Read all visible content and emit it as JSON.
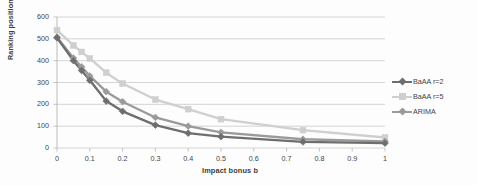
{
  "chart_data": {
    "type": "line",
    "title": "",
    "subtitle": "",
    "xlabel": "Impact bonus b",
    "ylabel": "Ranking position",
    "xlim": [
      0,
      1
    ],
    "ylim": [
      0,
      600
    ],
    "xticks": [
      "0",
      "0.1",
      "0.2",
      "0.3",
      "0.4",
      "0.5",
      "0.6",
      "0.7",
      "0.8",
      "0.9",
      "1"
    ],
    "xtick_values": [
      0,
      0.1,
      0.2,
      0.3,
      0.4,
      0.5,
      0.6,
      0.7,
      0.8,
      0.9,
      1
    ],
    "yticks": [
      "0",
      "100",
      "200",
      "300",
      "400",
      "500",
      "600"
    ],
    "ytick_values": [
      0,
      100,
      200,
      300,
      400,
      500,
      600
    ],
    "grid": "horizontal",
    "legend_position": "right",
    "x": [
      0,
      0.05,
      0.075,
      0.1,
      0.15,
      0.2,
      0.3,
      0.4,
      0.5,
      0.75,
      1
    ],
    "series": [
      {
        "name": "BaAA r=2",
        "color": "#6e6e6e",
        "marker": "diamond",
        "values": [
          505,
          400,
          355,
          310,
          215,
          168,
          105,
          68,
          52,
          28,
          22
        ]
      },
      {
        "name": "BaAA r=5",
        "color": "#cfcfcf",
        "marker": "square",
        "values": [
          540,
          470,
          440,
          410,
          345,
          295,
          222,
          178,
          132,
          82,
          48
        ]
      },
      {
        "name": "ARIMA",
        "color": "#9a9a9a",
        "marker": "diamond",
        "values": [
          508,
          412,
          372,
          330,
          258,
          212,
          140,
          100,
          72,
          40,
          30
        ]
      }
    ]
  },
  "legend": {
    "entries": [
      {
        "label": "BaAA r=2"
      },
      {
        "label": "BaAA r=5"
      },
      {
        "label": "ARIMA"
      }
    ]
  },
  "colors": {
    "background": "#fdfdfd",
    "gridline": "#c9c9c9",
    "axis": "#b4b4b4",
    "text": "#3f3f3f",
    "series_1": "#6e6e6e",
    "series_2": "#cfcfcf",
    "series_3": "#9a9a9a"
  }
}
